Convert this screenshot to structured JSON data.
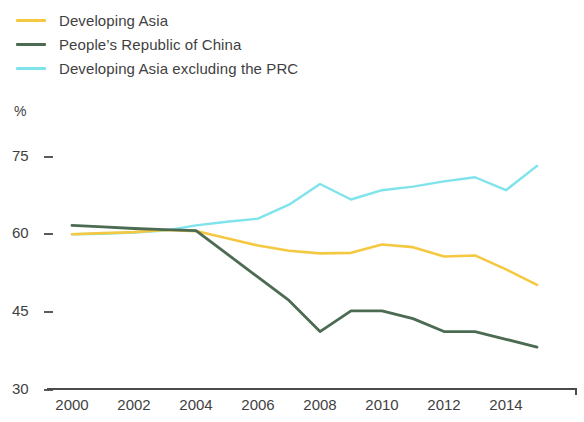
{
  "legend": {
    "position": "top-left",
    "items": [
      {
        "label": "Developing Asia",
        "color": "#F5C842",
        "key": "developing_asia"
      },
      {
        "label": "People’s Republic of China",
        "color": "#4C6B52",
        "key": "prc"
      },
      {
        "label": "Developing Asia excluding the PRC",
        "color": "#7FE3EC",
        "key": "developing_asia_ex_prc"
      }
    ]
  },
  "axes": {
    "y_unit": "%",
    "y_ticks": [
      "75",
      "60",
      "45",
      "30"
    ],
    "x_ticks": [
      "2000",
      "2002",
      "2004",
      "2006",
      "2008",
      "2010",
      "2012",
      "2014"
    ]
  },
  "chart_data": {
    "type": "line",
    "title": "",
    "subtitle": "",
    "xlabel": "",
    "ylabel": "%",
    "ylim": [
      30,
      78
    ],
    "xlim": [
      2000,
      2015
    ],
    "grid": false,
    "legend_position": "top-left",
    "x": [
      2000,
      2001,
      2002,
      2003,
      2004,
      2005,
      2006,
      2007,
      2008,
      2009,
      2010,
      2011,
      2012,
      2013,
      2014,
      2015
    ],
    "series": [
      {
        "name": "Developing Asia",
        "color": "#F5C842",
        "values": [
          59.8,
          60.0,
          60.2,
          60.6,
          60.4,
          59.0,
          57.6,
          56.6,
          56.1,
          56.2,
          57.8,
          57.3,
          55.5,
          55.7,
          53.0,
          50.0
        ]
      },
      {
        "name": "People’s Republic of China",
        "color": "#4C6B52",
        "values": [
          61.5,
          61.2,
          60.9,
          60.7,
          60.5,
          56.0,
          51.5,
          47.0,
          41.0,
          45.0,
          45.0,
          43.5,
          41.0,
          41.0,
          39.5,
          38.0
        ]
      },
      {
        "name": "Developing Asia excluding the PRC",
        "color": "#7FE3EC",
        "values": [
          59.8,
          59.9,
          60.1,
          60.5,
          61.5,
          62.2,
          62.8,
          65.5,
          69.5,
          66.5,
          68.3,
          69.0,
          70.0,
          70.8,
          68.3,
          73.0
        ]
      }
    ]
  }
}
